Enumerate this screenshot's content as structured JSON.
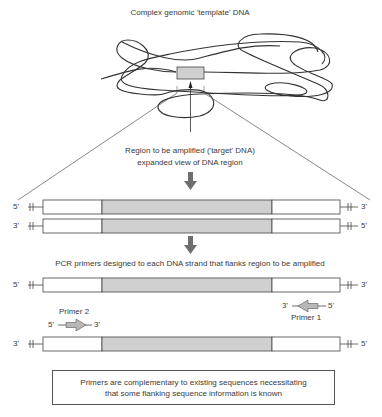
{
  "title": "Complex genomic 'template' DNA",
  "target_caption": {
    "line1": "Region to be amplified ('target' DNA)",
    "line2": "expanded view of DNA region"
  },
  "duplex": {
    "top_strand": {
      "left_end": "5'",
      "right_end": "3'"
    },
    "bottom_strand": {
      "left_end": "3'",
      "right_end": "5'"
    }
  },
  "primer_caption": "PCR primers designed to each DNA strand that flanks region to be amplified",
  "primed_strands": {
    "top_strand": {
      "left_end": "5'",
      "right_end": "3'"
    },
    "bottom_strand": {
      "left_end": "3'",
      "right_end": "5'"
    }
  },
  "primers": [
    {
      "name": "Primer 1",
      "left_end": "3'",
      "right_end": "5'",
      "direction": "left"
    },
    {
      "name": "Primer 2",
      "left_end": "5'",
      "right_end": "3'",
      "direction": "right"
    }
  ],
  "note": {
    "line1": "Primers are complementary to existing sequences necessitating",
    "line2": "that some flanking sequence information is known"
  },
  "colors": {
    "target_region": "#d0d0d0",
    "strand_outline": "#444444",
    "arrow": "#6e6e6e",
    "primer_fill": "#b8b8b8"
  }
}
